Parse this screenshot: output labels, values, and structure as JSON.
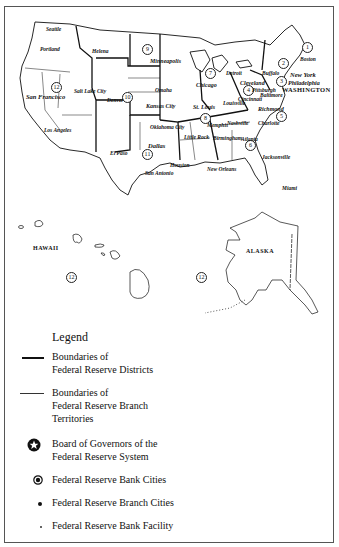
{
  "map": {
    "title": "Federal Reserve System",
    "districts": [
      {
        "number": "1",
        "city": "Boston"
      },
      {
        "number": "2",
        "city": "New York"
      },
      {
        "number": "3",
        "city": "Philadelphia"
      },
      {
        "number": "4",
        "city": "Cleveland"
      },
      {
        "number": "5",
        "city": "Richmond"
      },
      {
        "number": "6",
        "city": "Atlanta"
      },
      {
        "number": "7",
        "city": "Chicago"
      },
      {
        "number": "8",
        "city": "St. Louis"
      },
      {
        "number": "9",
        "city": "Minneapolis"
      },
      {
        "number": "10",
        "city": "Kansas City"
      },
      {
        "number": "11",
        "city": "Dallas"
      },
      {
        "number": "12",
        "city": "San Francisco"
      }
    ],
    "cities": {
      "seattle": "Seattle",
      "portland": "Portland",
      "helena": "Helena",
      "san_francisco": "San Francisco",
      "salt_lake_city": "Salt Lake City",
      "los_angeles": "Los Angeles",
      "denver": "Denver",
      "minneapolis": "Minneapolis",
      "omaha": "Omaha",
      "kansas_city": "Kansas City",
      "oklahoma_city": "Oklahoma City",
      "dallas": "Dallas",
      "el_paso": "El Paso",
      "san_antonio": "San Antonio",
      "houston": "Houston",
      "chicago": "Chicago",
      "detroit": "Detroit",
      "st_louis": "St. Louis",
      "louisville": "Louisville",
      "memphis": "Memphis",
      "little_rock": "Little Rock",
      "nashville": "Nashville",
      "birmingham": "Birmingham",
      "atlanta": "Atlanta",
      "new_orleans": "New Orleans",
      "jacksonville": "Jacksonville",
      "miami": "Miami",
      "cleveland": "Cleveland",
      "cincinnati": "Cincinnati",
      "pittsburgh": "Pittsburgh",
      "buffalo": "Buffalo",
      "baltimore": "Baltimore",
      "charlotte": "Charlotte",
      "richmond": "Richmond",
      "boston": "Boston",
      "new_york": "New York",
      "philadelphia": "Philadelphia",
      "washington": "WASHINGTON"
    },
    "insets": {
      "hawaii": "HAWAII",
      "alaska": "ALASKA",
      "hawaii_district": "12",
      "alaska_district": "12"
    }
  },
  "legend": {
    "title": "Legend",
    "items": [
      {
        "symbol": "thick-line",
        "line1": "Boundaries of",
        "line2": "Federal Reserve Districts"
      },
      {
        "symbol": "thin-line",
        "line1": "Boundaries of",
        "line2": "Federal Reserve Branch",
        "line3": "Territories"
      },
      {
        "symbol": "star-circle",
        "line1": "Board of Governors of the",
        "line2": "Federal Reserve System"
      },
      {
        "symbol": "bullseye",
        "line1": "Federal Reserve Bank Cities"
      },
      {
        "symbol": "dot",
        "line1": "Federal Reserve Branch Cities"
      },
      {
        "symbol": "small-dot",
        "line1": "Federal Reserve Bank Facility"
      }
    ]
  },
  "colors": {
    "ink": "#111111",
    "paper": "#ffffff",
    "frame": "#555555"
  }
}
